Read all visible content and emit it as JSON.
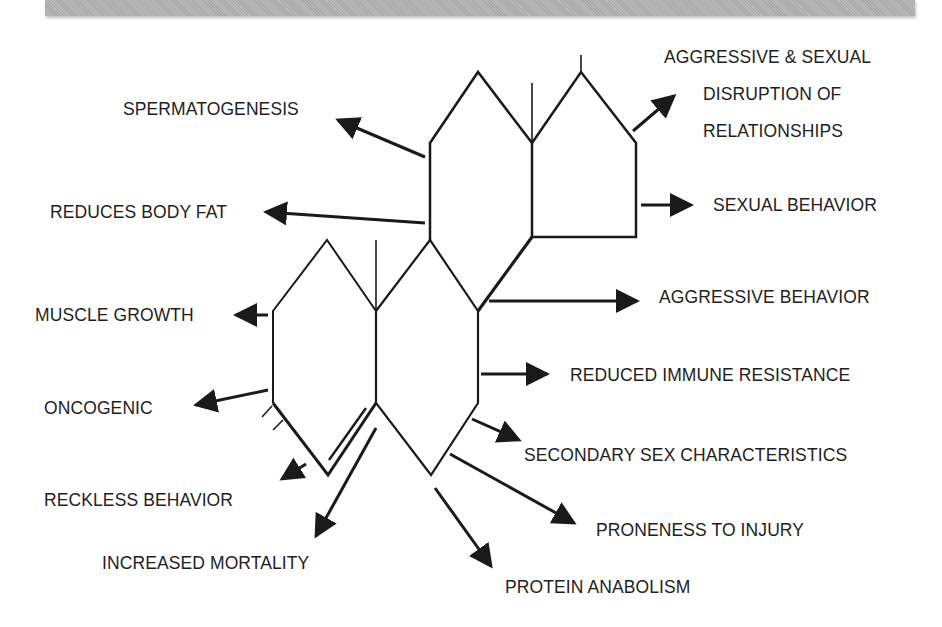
{
  "header": {
    "bar_color": "#b3b3b3"
  },
  "diagram": {
    "line_color": "#1a1a1a",
    "labels": {
      "spermatogenesis": "SPERMATOGENESIS",
      "reduces_body_fat": "REDUCES BODY FAT",
      "muscle_growth": "MUSCLE GROWTH",
      "oncogenic": "ONCOGENIC",
      "reckless_behavior": "RECKLESS BEHAVIOR",
      "increased_mortality": "INCREASED MORTALITY",
      "aggressive_sexual_line1": "AGGRESSIVE & SEXUAL",
      "aggressive_sexual_line2": "DISRUPTION OF",
      "aggressive_sexual_line3": "RELATIONSHIPS",
      "sexual_behavior": "SEXUAL BEHAVIOR",
      "aggressive_behavior": "AGGRESSIVE BEHAVIOR",
      "reduced_immune_resistance": "REDUCED IMMUNE RESISTANCE",
      "secondary_sex_characteristics": "SECONDARY SEX CHARACTERISTICS",
      "proneness_to_injury": "PRONENESS TO INJURY",
      "protein_anabolism": "PROTEIN ANABOLISM"
    }
  }
}
